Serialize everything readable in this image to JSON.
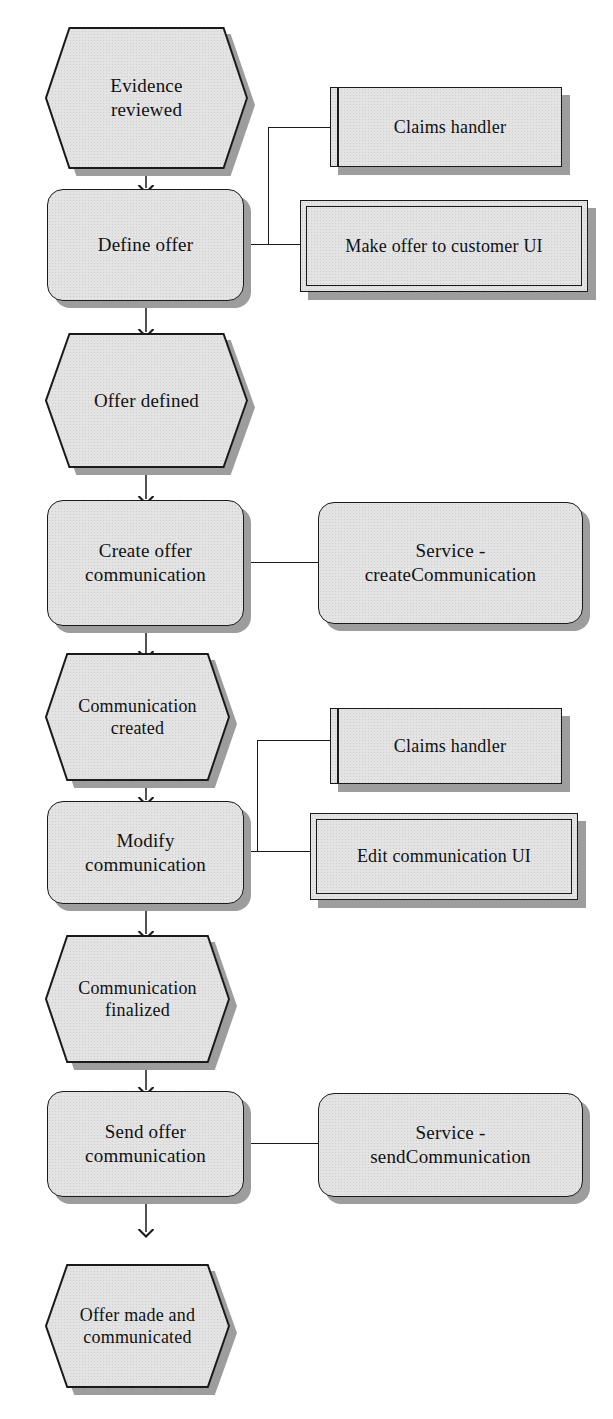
{
  "diagram": {
    "colors": {
      "node_fill": "#e3e3e3",
      "node_stroke": "#1a1a1a",
      "shadow": "#9d9d9d",
      "background": "#ffffff",
      "text": "#111111"
    }
  },
  "nodes": {
    "evidence_reviewed": {
      "label": "Evidence\nreviewed",
      "shape": "hexagon",
      "type": "event"
    },
    "define_offer": {
      "label": "Define offer",
      "shape": "rounded-rect",
      "type": "activity"
    },
    "claims_handler_1": {
      "label": "Claims handler",
      "shape": "actor-box",
      "type": "actor"
    },
    "make_offer_ui": {
      "label": "Make offer to customer UI",
      "shape": "boundary-box",
      "type": "ui"
    },
    "offer_defined": {
      "label": "Offer defined",
      "shape": "hexagon",
      "type": "event"
    },
    "create_offer_communication": {
      "label": "Create offer\ncommunication",
      "shape": "rounded-rect",
      "type": "activity"
    },
    "service_create_communication": {
      "label": "Service -\ncreateCommunication",
      "shape": "rounded-rect",
      "type": "service"
    },
    "communication_created": {
      "label": "Communication\ncreated",
      "shape": "hexagon",
      "type": "event"
    },
    "claims_handler_2": {
      "label": "Claims handler",
      "shape": "actor-box",
      "type": "actor"
    },
    "modify_communication": {
      "label": "Modify\ncommunication",
      "shape": "rounded-rect",
      "type": "activity"
    },
    "edit_communication_ui": {
      "label": "Edit communication UI",
      "shape": "boundary-box",
      "type": "ui"
    },
    "communication_finalized": {
      "label": "Communication\nfinalized",
      "shape": "hexagon",
      "type": "event"
    },
    "send_offer_communication": {
      "label": "Send offer\ncommunication",
      "shape": "rounded-rect",
      "type": "activity"
    },
    "service_send_communication": {
      "label": "Service -\nsendCommunication",
      "shape": "rounded-rect",
      "type": "service"
    },
    "offer_made_and_communicated": {
      "label": "Offer made and\ncommunicated",
      "shape": "hexagon",
      "type": "event"
    }
  },
  "edges": [
    {
      "from": "evidence_reviewed",
      "to": "define_offer",
      "kind": "arrow"
    },
    {
      "from": "define_offer",
      "to": "claims_handler_1",
      "kind": "association"
    },
    {
      "from": "define_offer",
      "to": "make_offer_ui",
      "kind": "association"
    },
    {
      "from": "define_offer",
      "to": "offer_defined",
      "kind": "arrow"
    },
    {
      "from": "offer_defined",
      "to": "create_offer_communication",
      "kind": "arrow"
    },
    {
      "from": "create_offer_communication",
      "to": "service_create_communication",
      "kind": "association"
    },
    {
      "from": "create_offer_communication",
      "to": "communication_created",
      "kind": "arrow"
    },
    {
      "from": "communication_created",
      "to": "modify_communication",
      "kind": "arrow"
    },
    {
      "from": "modify_communication",
      "to": "claims_handler_2",
      "kind": "association"
    },
    {
      "from": "modify_communication",
      "to": "edit_communication_ui",
      "kind": "association"
    },
    {
      "from": "modify_communication",
      "to": "communication_finalized",
      "kind": "arrow"
    },
    {
      "from": "communication_finalized",
      "to": "send_offer_communication",
      "kind": "arrow"
    },
    {
      "from": "send_offer_communication",
      "to": "service_send_communication",
      "kind": "association"
    },
    {
      "from": "send_offer_communication",
      "to": "offer_made_and_communicated",
      "kind": "arrow"
    }
  ]
}
